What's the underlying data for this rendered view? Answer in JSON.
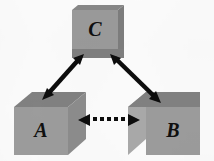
{
  "diagram": {
    "background_color": "#fbfbfb",
    "nodes": [
      {
        "id": "C",
        "label": "C",
        "position": "top-center",
        "shape": "3d-box",
        "front_face_color": "#9a9a9a",
        "top_face_color": "#878787",
        "side_face_color": "#7d7d7d",
        "label_color": "#101010"
      },
      {
        "id": "A",
        "label": "A",
        "position": "bottom-left",
        "shape": "3d-box",
        "front_face_color": "#9c9c9c",
        "top_face_color": "#818181",
        "side_face_color": "#8c8c8c",
        "label_color": "#101010"
      },
      {
        "id": "B",
        "label": "B",
        "position": "bottom-right",
        "shape": "3d-box",
        "front_face_color": "#9c9c9c",
        "top_face_color": "#818181",
        "side_face_color": "#a9a9a9",
        "label_color": "#101010"
      }
    ],
    "connectors": [
      {
        "id": "c-to-a",
        "from": "C",
        "to": "A",
        "style": "solid",
        "arrowheads": "double",
        "color": "#0d0d0d",
        "orientation": "diagonal-down-left"
      },
      {
        "id": "c-to-b",
        "from": "C",
        "to": "B",
        "style": "solid",
        "arrowheads": "double",
        "color": "#0d0d0d",
        "orientation": "diagonal-down-right"
      },
      {
        "id": "a-to-b",
        "from": "A",
        "to": "B",
        "style": "dotted",
        "arrowheads": "double",
        "color": "#0d0d0d",
        "orientation": "horizontal",
        "dot_count": 5
      }
    ]
  }
}
